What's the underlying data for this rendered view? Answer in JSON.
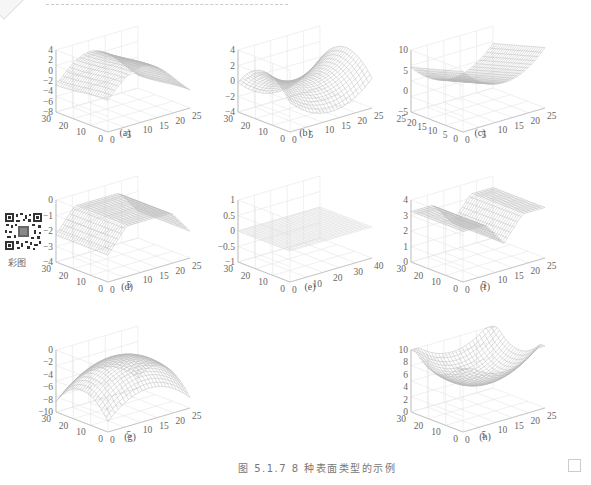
{
  "header": {
    "decoration": "dashed-rule"
  },
  "qr": {
    "label": "彩图"
  },
  "caption": "图 5.1.7   8 种表面类型的示例",
  "chart_data": [
    {
      "type": "surface",
      "label": "(a)",
      "title": "",
      "zticks": [
        "4",
        "2",
        "0",
        "−2",
        "−4",
        "−6",
        "−8"
      ],
      "zlim": [
        -8,
        4
      ],
      "yticks": [
        "30",
        "20",
        "10",
        "0"
      ],
      "xticks": [
        "0",
        "5",
        "10",
        "15",
        "20",
        "25"
      ],
      "shape": "ridge (saddle-like peak and trough)"
    },
    {
      "type": "surface",
      "label": "(b)",
      "zticks": [
        "4",
        "2",
        "0",
        "−2",
        "−4"
      ],
      "zlim": [
        -4,
        4
      ],
      "yticks": [
        "30",
        "20",
        "10",
        "0"
      ],
      "xticks": [
        "0",
        "5",
        "10",
        "15",
        "20",
        "25"
      ],
      "shape": "saddle"
    },
    {
      "type": "surface",
      "label": "(c)",
      "zticks": [
        "10",
        "5",
        "0",
        "−5"
      ],
      "zlim": [
        -5,
        10
      ],
      "yticks": [
        "25",
        "20",
        "15",
        "10",
        "5",
        "0"
      ],
      "xticks": [
        "0",
        "5",
        "10",
        "15",
        "20",
        "25"
      ],
      "shape": "valley (trough)"
    },
    {
      "type": "surface",
      "label": "(d)",
      "zticks": [
        "0",
        "−1",
        "−2",
        "−3",
        "−4"
      ],
      "zlim": [
        -4,
        0
      ],
      "yticks": [
        "30",
        "20",
        "10",
        "0"
      ],
      "xticks": [
        "0",
        "5",
        "10",
        "15",
        "20",
        "25"
      ],
      "shape": "ridge (flat top)"
    },
    {
      "type": "surface",
      "label": "(e)",
      "zticks": [
        "1",
        "0.5",
        "0",
        "−0.5",
        "−1"
      ],
      "zlim": [
        -1,
        1
      ],
      "yticks": [
        "30",
        "20",
        "10",
        "0"
      ],
      "xticks": [
        "0",
        "10",
        "20",
        "30",
        "40"
      ],
      "shape": "flat plane"
    },
    {
      "type": "surface",
      "label": "(f)",
      "zticks": [
        "4",
        "3",
        "2",
        "1",
        "0"
      ],
      "zlim": [
        0,
        4
      ],
      "yticks": [
        "30",
        "20",
        "10",
        "0"
      ],
      "xticks": [
        "0",
        "5",
        "10",
        "15",
        "20",
        "25"
      ],
      "shape": "valley (flat bottom)"
    },
    {
      "type": "surface",
      "label": "(g)",
      "zticks": [
        "0",
        "−2",
        "−4",
        "−6",
        "−8",
        "−10"
      ],
      "zlim": [
        -10,
        0
      ],
      "yticks": [
        "30",
        "20",
        "10",
        "0"
      ],
      "xticks": [
        "0",
        "5",
        "10",
        "15",
        "20",
        "25"
      ],
      "shape": "peak (dome)"
    },
    {
      "type": "surface",
      "label": "(h)",
      "zticks": [
        "10",
        "8",
        "6",
        "4",
        "2",
        "0"
      ],
      "zlim": [
        0,
        10
      ],
      "yticks": [
        "30",
        "20",
        "10",
        "0"
      ],
      "xticks": [
        "0",
        "5",
        "10",
        "15",
        "20",
        "25"
      ],
      "shape": "pit (bowl)"
    }
  ]
}
